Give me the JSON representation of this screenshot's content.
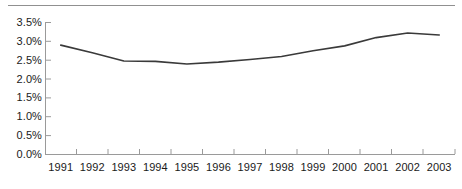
{
  "chart_data": {
    "type": "line",
    "title": "",
    "subtitle": "",
    "xlabel": "",
    "ylabel": "",
    "categories": [
      "1991",
      "1992",
      "1993",
      "1994",
      "1995",
      "1996",
      "1997",
      "1998",
      "1999",
      "2000",
      "2001",
      "2002",
      "2003"
    ],
    "series": [
      {
        "name": "",
        "values": [
          2.9,
          2.7,
          2.48,
          2.47,
          2.4,
          2.45,
          2.52,
          2.6,
          2.75,
          2.88,
          3.1,
          3.22,
          3.17
        ]
      }
    ],
    "ylim": [
      0.0,
      3.5
    ],
    "y_ticks": [
      0.0,
      0.5,
      1.0,
      1.5,
      2.0,
      2.5,
      3.0,
      3.5
    ],
    "y_tick_labels": [
      "0.0%",
      "0.5%",
      "1.0%",
      "1.5%",
      "2.0%",
      "2.5%",
      "3.0%",
      "3.5%"
    ],
    "grid": false,
    "legend": null,
    "legend_position": "none",
    "annotations": [],
    "colors": {
      "line": "#3a3a3a",
      "axis": "#9a9a9a",
      "tick_label": "#1a1a1a",
      "top_rule": "#909090",
      "background": "#ffffff"
    }
  },
  "axes": {
    "y_tick_labels": [
      "3.5%",
      "3.0%",
      "2.5%",
      "2.0%",
      "1.5%",
      "1.0%",
      "0.5%",
      "0.0%"
    ],
    "x_tick_labels": [
      "1991",
      "1992",
      "1993",
      "1994",
      "1995",
      "1996",
      "1997",
      "1998",
      "1999",
      "2000",
      "2001",
      "2002",
      "2003"
    ]
  }
}
